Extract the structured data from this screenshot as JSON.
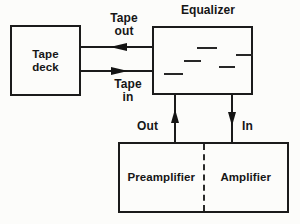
{
  "diagram": {
    "type": "block-diagram",
    "colors": {
      "line": "#1b1b1b",
      "text": "#161616",
      "background": "#fcfcfa"
    },
    "boxes": {
      "tape_deck": {
        "label": "Tape\ndeck"
      },
      "equalizer": {
        "title": "Equalizer",
        "slider_marks": [
          {
            "x": 43,
            "y": 19,
            "w": 20
          },
          {
            "x": 82,
            "y": 26,
            "w": 17
          },
          {
            "x": 30,
            "y": 32,
            "w": 17
          },
          {
            "x": 65,
            "y": 38,
            "w": 16
          },
          {
            "x": 10,
            "y": 45,
            "w": 19
          }
        ]
      },
      "preamp_amp": {
        "left_label": "Preamplifier",
        "right_label": "Amplifier"
      }
    },
    "arrows": {
      "tape_out": {
        "label": "Tape\nout",
        "direction": "left"
      },
      "tape_in": {
        "label": "Tape\nin",
        "direction": "right"
      },
      "out": {
        "label": "Out",
        "direction": "up"
      },
      "in": {
        "label": "In",
        "direction": "down"
      }
    }
  }
}
